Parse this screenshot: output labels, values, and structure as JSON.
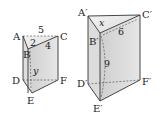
{
  "diagram": {
    "type": "two triangular prisms",
    "left_prism": {
      "vertices": {
        "A": {
          "label": "A",
          "x": 23,
          "y": 36
        },
        "B": {
          "label": "B",
          "x": 28,
          "y": 49
        },
        "C": {
          "label": "C",
          "x": 58,
          "y": 36
        },
        "D": {
          "label": "D",
          "x": 23,
          "y": 80
        },
        "E": {
          "label": "E",
          "x": 32,
          "y": 93
        },
        "F": {
          "label": "F",
          "x": 58,
          "y": 80
        }
      },
      "measures": {
        "AC": "5",
        "AB": "2",
        "BC": "4",
        "height": "y"
      }
    },
    "right_prism": {
      "vertices": {
        "A": {
          "label": "A′",
          "x": 88,
          "y": 16
        },
        "B": {
          "label": "B′",
          "x": 100,
          "y": 33
        },
        "C": {
          "label": "C′",
          "x": 140,
          "y": 15
        },
        "D": {
          "label": "D′",
          "x": 88,
          "y": 84
        },
        "E": {
          "label": "E′",
          "x": 100,
          "y": 101
        },
        "F": {
          "label": "F′",
          "x": 140,
          "y": 80
        }
      },
      "measures": {
        "AB": "x",
        "BC": "6",
        "height": "9"
      }
    }
  },
  "colors": {
    "face_light": "#ececec",
    "face_mid": "#d6d6d6",
    "face_dark": "#bdbdbd",
    "edge": "#333333"
  }
}
